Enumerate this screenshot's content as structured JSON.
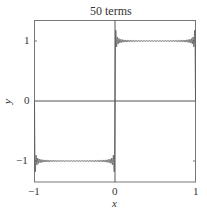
{
  "chart_data": {
    "type": "line",
    "title": "50 terms",
    "xlabel": "x",
    "ylabel": "y",
    "xlim": [
      -1,
      1
    ],
    "ylim": [
      -1.35,
      1.35
    ],
    "xticks": [
      -1,
      0,
      1
    ],
    "xtick_labels": [
      "−1",
      "0",
      "1"
    ],
    "yticks": [
      -1,
      0,
      1
    ],
    "ytick_labels": [
      "−1",
      "0",
      "1"
    ],
    "grid": false,
    "axes_lines": {
      "x_zero": true,
      "y_zero": true
    },
    "series": [
      {
        "name": "Fourier series of square wave (50 terms)",
        "function": "sum_{k=1}^{50} (4/pi) * sin((2k-1) pi x)/(2k-1)",
        "color": "#555555",
        "description": "Square wave approximation: about -1 for x<0 and +1 for x>0, with Gibbs overshoot near x=0"
      }
    ]
  },
  "labels": {
    "title": "50 terms",
    "x_axis": "x",
    "y_axis": "y",
    "x_ticks": [
      "−1",
      "0",
      "1"
    ],
    "y_ticks": [
      "1",
      "0",
      "−1"
    ]
  }
}
